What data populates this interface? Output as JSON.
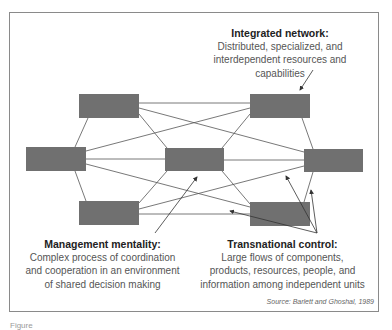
{
  "diagram": {
    "type": "network",
    "node_color": "#707070",
    "line_color": "#555555",
    "nodes": [
      {
        "id": "top-left",
        "x": 79,
        "y": 94,
        "w": 60,
        "h": 24
      },
      {
        "id": "top-right",
        "x": 250,
        "y": 94,
        "w": 60,
        "h": 24
      },
      {
        "id": "mid-left",
        "x": 26,
        "y": 147,
        "w": 60,
        "h": 24
      },
      {
        "id": "center",
        "x": 165,
        "y": 148,
        "w": 59,
        "h": 23
      },
      {
        "id": "mid-right",
        "x": 304,
        "y": 149,
        "w": 59,
        "h": 23
      },
      {
        "id": "bottom-left",
        "x": 79,
        "y": 201,
        "w": 60,
        "h": 24
      },
      {
        "id": "bottom-right",
        "x": 250,
        "y": 202,
        "w": 60,
        "h": 24
      }
    ],
    "edges": [
      [
        "top-left",
        "top-right"
      ],
      [
        "top-left",
        "mid-left"
      ],
      [
        "top-left",
        "center"
      ],
      [
        "top-left",
        "mid-right"
      ],
      [
        "top-right",
        "mid-left"
      ],
      [
        "top-right",
        "center"
      ],
      [
        "top-right",
        "mid-right"
      ],
      [
        "mid-left",
        "center"
      ],
      [
        "mid-left",
        "bottom-left"
      ],
      [
        "mid-left",
        "bottom-right"
      ],
      [
        "center",
        "mid-right"
      ],
      [
        "center",
        "bottom-left"
      ],
      [
        "center",
        "bottom-right"
      ],
      [
        "mid-right",
        "bottom-left"
      ],
      [
        "mid-right",
        "bottom-right"
      ],
      [
        "bottom-left",
        "bottom-right"
      ]
    ]
  },
  "annotations": {
    "integrated": {
      "title": "Integrated network:",
      "lines": [
        "Distributed, specialized, and",
        "interdependent resources and",
        "capabilities"
      ]
    },
    "management": {
      "title": "Management mentality:",
      "lines": [
        "Complex process of coordination",
        "and cooperation in an environment",
        "of shared decision making"
      ]
    },
    "transnational": {
      "title": "Transnational control:",
      "lines": [
        "Large flows of components,",
        "products, resources, people, and",
        "information among independent units"
      ]
    }
  },
  "source": "Source: Barlett and Ghoshal, 1989",
  "caption": "Figure"
}
